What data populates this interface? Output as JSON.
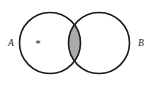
{
  "figure": {
    "type": "venn-diagram",
    "background_color": "#ffffff",
    "stroke_color": "#1a1a1a",
    "stroke_width": 1.6,
    "shaded_fill_color": "#aaaaaa",
    "width": 149,
    "height": 86
  },
  "sets": [
    {
      "id": "A",
      "label": "A",
      "label_x": 8,
      "label_y": 44,
      "circle_cx": 50,
      "circle_cy": 43,
      "circle_r": 30.5,
      "shaded": false
    },
    {
      "id": "B",
      "label": "B",
      "label_x": 138,
      "label_y": 44,
      "circle_cx": 99,
      "circle_cy": 43,
      "circle_r": 30.5,
      "shaded": false
    }
  ],
  "regions": [
    {
      "id": "intersection",
      "name": "A-intersect-B",
      "shaded": true,
      "fill_color": "#aaaaaa"
    }
  ],
  "marks": [
    {
      "id": "element-point",
      "glyph": "*",
      "x": 38,
      "y": 44,
      "in_region": "A-only"
    }
  ]
}
